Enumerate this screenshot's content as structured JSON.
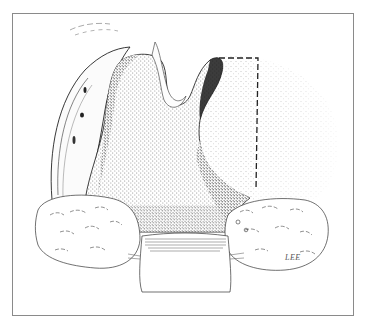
{
  "illustration": {
    "subject": "stippled anatomical surgical illustration",
    "signature": "LEE",
    "frame_color": "#8a8a8a",
    "ink_color": "#1a1a1a",
    "paper_color": "#ffffff",
    "dashed_line": {
      "points": [
        [
          219,
          58
        ],
        [
          258,
          58
        ],
        [
          256,
          190
        ]
      ],
      "style": "dashed"
    }
  }
}
